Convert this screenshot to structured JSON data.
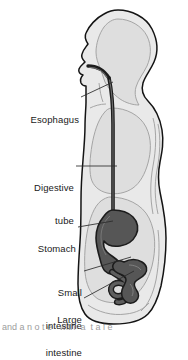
{
  "figure": {
    "colors": {
      "background": "#ffffff",
      "body_outline": "#141414",
      "body_fill": "#e8e8e8",
      "inner_cavity_fill": "#dcdcdc",
      "inner_outline": "#9a9a9a",
      "organ_fill": "#565656",
      "organ_outline": "#1c1c1c",
      "leader_line": "#2a2a2a",
      "label_text": "#1a1a1a"
    },
    "labels": [
      {
        "id": "esophagus",
        "text": "Esophagus",
        "lines": [
          "Esophagus"
        ],
        "x": 18,
        "y": 92,
        "leader_from": [
          81,
          97
        ],
        "leader_to": [
          113,
          82
        ]
      },
      {
        "id": "digestive-tube",
        "text": "Digestive tube",
        "lines": [
          "Digestive",
          "tube"
        ],
        "x": 22,
        "y": 160,
        "leader_from": [
          76,
          166
        ],
        "leader_to": [
          117,
          166
        ]
      },
      {
        "id": "stomach",
        "text": "Stomach",
        "lines": [
          "Stomach"
        ],
        "x": 19,
        "y": 222,
        "leader_from": [
          78,
          227
        ],
        "leader_to": [
          113,
          221
        ]
      },
      {
        "id": "small-intestine",
        "text": "Small intestine",
        "lines": [
          "Small",
          "intestine"
        ],
        "x": 30,
        "y": 266,
        "leader_from": [
          84,
          271
        ],
        "leader_to": [
          128,
          258
        ]
      },
      {
        "id": "large-intestine",
        "text": "Large intestine",
        "lines": [
          "Large",
          "intestine"
        ],
        "x": 30,
        "y": 293,
        "leader_from": [
          84,
          298
        ],
        "leader_to": [
          133,
          272
        ]
      }
    ],
    "caption_fragment": "and a n o t e   with  a  t a l e"
  }
}
